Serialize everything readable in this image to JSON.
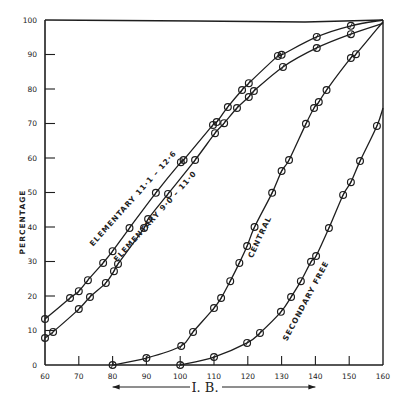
{
  "chart_data": {
    "type": "line",
    "title": "",
    "xlabel": "I. B.",
    "ylabel": "PERCENTAGE",
    "xlim": [
      60,
      160
    ],
    "ylim": [
      0,
      100
    ],
    "x_ticks": [
      60,
      70,
      80,
      90,
      100,
      110,
      120,
      130,
      140,
      150,
      160
    ],
    "y_ticks": [
      0,
      10,
      20,
      30,
      40,
      50,
      60,
      70,
      80,
      90,
      100
    ],
    "grid": false,
    "legend": "inline labels along curves",
    "xlabel_arrow": {
      "from": 80,
      "to": 140,
      "double_headed": true
    },
    "series": [
      {
        "name": "ELEMENTARY 11·1 – 12·6",
        "label_pos": {
          "x": 135,
          "y": 200,
          "angle": -48
        },
        "points": [
          [
            60,
            13.3
          ],
          [
            67.4,
            19.4
          ],
          [
            70,
            21.4
          ],
          [
            72.7,
            24.6
          ],
          [
            77.2,
            29.6
          ],
          [
            80,
            33
          ],
          [
            85,
            39.7
          ],
          [
            92.8,
            49.9
          ],
          [
            100.2,
            58.8
          ],
          [
            101,
            59.4
          ],
          [
            109.7,
            69.6
          ],
          [
            110.8,
            70.4
          ],
          [
            114.1,
            74.8
          ],
          [
            118.3,
            79.7
          ],
          [
            120.3,
            81.7
          ],
          [
            128.9,
            89.6
          ],
          [
            130,
            89.9
          ],
          [
            140.4,
            95.1
          ],
          [
            150.5,
            98.3
          ],
          [
            160,
            100
          ]
        ]
      },
      {
        "name": "ELEMENTARY 9·0 – 11·0",
        "label_pos": {
          "x": 157,
          "y": 218,
          "angle": -48
        },
        "points": [
          [
            60,
            7.8
          ],
          [
            62.4,
            9.6
          ],
          [
            70,
            16.2
          ],
          [
            73.3,
            19.7
          ],
          [
            78,
            23.8
          ],
          [
            80.4,
            27.2
          ],
          [
            81.6,
            29.3
          ],
          [
            89.3,
            39.7
          ],
          [
            90.5,
            42.3
          ],
          [
            96.4,
            49.6
          ],
          [
            104.4,
            59.4
          ],
          [
            110.3,
            67.2
          ],
          [
            113,
            70.1
          ],
          [
            116.8,
            74.5
          ],
          [
            120.3,
            77.7
          ],
          [
            121.8,
            79.4
          ],
          [
            130.4,
            86.4
          ],
          [
            140.4,
            91.9
          ],
          [
            150.5,
            95.9
          ],
          [
            160,
            99
          ]
        ]
      },
      {
        "name": "CENTRAL",
        "label_pos": {
          "x": 262,
          "y": 238,
          "angle": -65
        },
        "points": [
          [
            80,
            0
          ],
          [
            90,
            2
          ],
          [
            100.3,
            5.5
          ],
          [
            103.8,
            9.6
          ],
          [
            110,
            16.5
          ],
          [
            112.1,
            19.4
          ],
          [
            114.8,
            24.3
          ],
          [
            117.5,
            29.6
          ],
          [
            119.8,
            34.5
          ],
          [
            122,
            40
          ],
          [
            127.2,
            49.9
          ],
          [
            130,
            56.2
          ],
          [
            132.2,
            59.4
          ],
          [
            137.2,
            69.9
          ],
          [
            139.6,
            74.5
          ],
          [
            141,
            76.2
          ],
          [
            143.3,
            79.7
          ],
          [
            150.5,
            89
          ],
          [
            152,
            90.1
          ],
          [
            160,
            99.5
          ]
        ]
      },
      {
        "name": "SECONDARY FREE",
        "label_pos": {
          "x": 308,
          "y": 302,
          "angle": -62
        },
        "points": [
          [
            100,
            0
          ],
          [
            110,
            2.3
          ],
          [
            119.8,
            6.4
          ],
          [
            123.6,
            9.3
          ],
          [
            129.8,
            15.4
          ],
          [
            132.8,
            19.7
          ],
          [
            135.7,
            24.3
          ],
          [
            138.7,
            29.9
          ],
          [
            140.2,
            31.6
          ],
          [
            144,
            39.7
          ],
          [
            148.2,
            49.3
          ],
          [
            150.5,
            53
          ],
          [
            153.2,
            59.1
          ],
          [
            158.2,
            69.3
          ],
          [
            160,
            74.5
          ]
        ]
      }
    ]
  },
  "plot_area": {
    "left": 45,
    "right": 383,
    "top": 20,
    "bottom": 365
  },
  "colors": {
    "ink": "#1e1e1e",
    "background": "#ffffff"
  }
}
